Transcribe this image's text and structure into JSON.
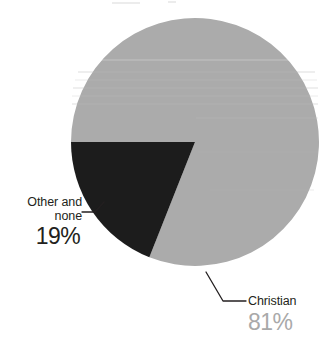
{
  "chart_data": {
    "type": "pie",
    "title": "",
    "categories": [
      "Christian",
      "Other and none"
    ],
    "values": [
      81,
      19
    ],
    "value_labels": [
      "81%",
      "19%"
    ],
    "units": "percent",
    "colors": [
      "#ababab",
      "#1c1c1c"
    ],
    "legend": "none",
    "grid": false,
    "slices": [
      {
        "label": "Christian",
        "value": 81,
        "value_label": "81%",
        "color": "#ababab",
        "label_color": "#a9a9a9",
        "start_angle_deg": 180,
        "end_angle_deg": 111.6
      },
      {
        "label": "Other and none",
        "label_line1": "Other and",
        "label_line2": "none",
        "value": 19,
        "value_label": "19%",
        "color": "#1c1c1c",
        "label_color": "#231f20",
        "start_angle_deg": 111.6,
        "end_angle_deg": 180
      }
    ]
  },
  "figure": {
    "background": "#ffffff",
    "pie": {
      "center_x": 195,
      "center_y": 142,
      "radius": 124
    },
    "leader_line_color": "#231f20"
  }
}
